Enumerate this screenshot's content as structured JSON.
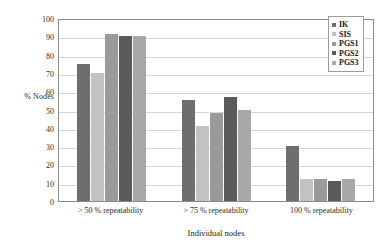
{
  "chart_data": {
    "type": "bar",
    "title": "",
    "xlabel": "Individual nodes",
    "ylabel": "% Nodes",
    "ylim": [
      0,
      100
    ],
    "yticks": [
      0,
      10,
      20,
      30,
      40,
      50,
      60,
      70,
      80,
      90,
      100
    ],
    "grid": true,
    "legend_position": "top-right",
    "categories": [
      "> 50 % repeatability",
      "> 75 % repeatability",
      "100 %  repeatability"
    ],
    "series": [
      {
        "name": "IK",
        "color": "#6e6e6e",
        "values": [
          75,
          55,
          30
        ]
      },
      {
        "name": "SIS",
        "color": "#c2c2c2",
        "values": [
          70,
          41,
          12
        ]
      },
      {
        "name": "PGS1",
        "color": "#9a9a9a",
        "values": [
          91,
          48,
          12
        ]
      },
      {
        "name": "PGS2",
        "color": "#5a5a5a",
        "values": [
          90,
          57,
          11
        ]
      },
      {
        "name": "PGS3",
        "color": "#a8a8a8",
        "values": [
          90,
          50,
          12
        ]
      }
    ]
  }
}
